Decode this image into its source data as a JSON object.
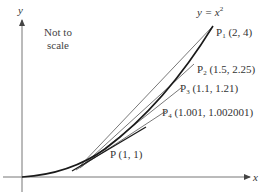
{
  "diagram": {
    "note_line1": "Not to",
    "note_line2": "scale",
    "axis_x_label": "x",
    "axis_y_label": "y",
    "curve_label": {
      "lhs": "y = x",
      "exp": "2"
    },
    "point_p": {
      "name": "P",
      "coords": "(1, 1)"
    },
    "points": [
      {
        "name": "P",
        "sub": "1",
        "coords": "(2, 4)"
      },
      {
        "name": "P",
        "sub": "2",
        "coords": "(1.5, 2.25)"
      },
      {
        "name": "P",
        "sub": "3",
        "coords": "(1.1, 1.21)"
      },
      {
        "name": "P",
        "sub": "4",
        "coords": "(1.001, 1.002001)"
      }
    ],
    "colors": {
      "curve": "#1a1a1a",
      "secant": "#555555",
      "axis": "#777777"
    }
  }
}
